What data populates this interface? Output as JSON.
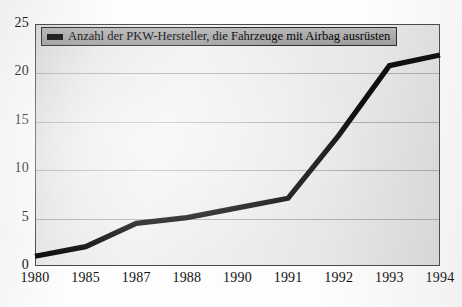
{
  "chart_data": {
    "type": "line",
    "title": "",
    "subtitle": "",
    "xlabel": "",
    "ylabel": "",
    "categories": [
      "1980",
      "1985",
      "1987",
      "1988",
      "1990",
      "1991",
      "1992",
      "1993",
      "1994"
    ],
    "series": [
      {
        "name": "Anzahl der PKW-Hersteller, die Fahrzeuge mit Airbag ausrüsten",
        "values": [
          1,
          2,
          4.4,
          5,
          6,
          7,
          13.5,
          20.7,
          21.8
        ],
        "color": "#0d0d0d"
      }
    ],
    "ylim": [
      0,
      25
    ],
    "yticks": [
      0,
      5,
      10,
      15,
      20,
      25
    ],
    "ytick_labels": [
      "0",
      "5",
      "10",
      "15",
      "20",
      "25"
    ],
    "grid": true,
    "grid_axis": "y",
    "legend_position": "top-left",
    "legend_entries": [
      "Anzahl der PKW-Hersteller, die Fahrzeuge mit Airbag ausrüsten"
    ]
  },
  "legend": {
    "label": "Anzahl der PKW-Hersteller, die Fahrzeuge mit Airbag ausrüsten"
  },
  "colors": {
    "series_line": "#0d0d0d",
    "plot_background": "#ededed",
    "grid": "#9a9a9a",
    "frame": "#4a4a4a",
    "legend_background": "#a8a8a8",
    "text": "#111111"
  }
}
